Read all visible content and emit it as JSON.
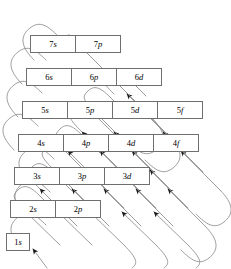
{
  "diagram": {
    "caption_fragment": "",
    "colors": {
      "background": "#ffffff",
      "box_border": "#6f6f6f",
      "arrow_line": "#8c8c8c",
      "arrow_head": "#1a1a1a",
      "text": "#000000"
    },
    "rows": [
      {
        "principal": "7",
        "left": 30,
        "top": 35,
        "height": 18,
        "cell_width": 46,
        "cells": [
          {
            "n": "7",
            "l": "s",
            "label": "7s"
          },
          {
            "n": "7",
            "l": "p",
            "label": "7p"
          }
        ]
      },
      {
        "principal": "6",
        "left": 26,
        "top": 68,
        "height": 18,
        "cell_width": 46,
        "cells": [
          {
            "n": "6",
            "l": "s",
            "label": "6s"
          },
          {
            "n": "6",
            "l": "p",
            "label": "6p"
          },
          {
            "n": "6",
            "l": "d",
            "label": "6d"
          }
        ]
      },
      {
        "principal": "5",
        "left": 22,
        "top": 101,
        "height": 18,
        "cell_width": 46,
        "cells": [
          {
            "n": "5",
            "l": "s",
            "label": "5s"
          },
          {
            "n": "5",
            "l": "p",
            "label": "5p"
          },
          {
            "n": "5",
            "l": "d",
            "label": "5d"
          },
          {
            "n": "5",
            "l": "f",
            "label": "5f"
          }
        ]
      },
      {
        "principal": "4",
        "left": 18,
        "top": 134,
        "height": 18,
        "cell_width": 46,
        "cells": [
          {
            "n": "4",
            "l": "s",
            "label": "4s"
          },
          {
            "n": "4",
            "l": "p",
            "label": "4p"
          },
          {
            "n": "4",
            "l": "d",
            "label": "4d"
          },
          {
            "n": "4",
            "l": "f",
            "label": "4f"
          }
        ]
      },
      {
        "principal": "3",
        "left": 14,
        "top": 167,
        "height": 18,
        "cell_width": 46,
        "cells": [
          {
            "n": "3",
            "l": "s",
            "label": "3s"
          },
          {
            "n": "3",
            "l": "p",
            "label": "3p"
          },
          {
            "n": "3",
            "l": "d",
            "label": "3d"
          }
        ]
      },
      {
        "principal": "2",
        "left": 10,
        "top": 200,
        "height": 18,
        "cell_width": 46,
        "cells": [
          {
            "n": "2",
            "l": "s",
            "label": "2s"
          },
          {
            "n": "2",
            "l": "p",
            "label": "2p"
          }
        ]
      },
      {
        "principal": "1",
        "left": 6,
        "top": 233,
        "height": 18,
        "cell_width": 24,
        "cells": [
          {
            "n": "1",
            "l": "s",
            "label": "1s"
          }
        ]
      }
    ],
    "fill_order": [
      "1s",
      "2s",
      "2p",
      "3s",
      "3p",
      "4s",
      "3d",
      "4p",
      "5s",
      "4d",
      "5p",
      "6s",
      "4f",
      "5d",
      "6p",
      "7s",
      "5f",
      "6d",
      "7p"
    ],
    "arrow_count": 8,
    "arrow_direction": "up-left along diagonals"
  }
}
